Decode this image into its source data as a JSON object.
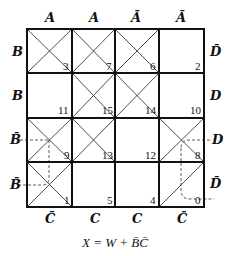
{
  "kmap": {
    "col_labels_top": [
      "A",
      "A",
      "Ā",
      "Ā"
    ],
    "col_labels_bottom": [
      "C̄",
      "C",
      "C",
      "C̄"
    ],
    "row_labels_left": [
      "B",
      "B",
      "B̄",
      "B̄"
    ],
    "row_labels_right": [
      "D̄",
      "D",
      "D",
      "D̄"
    ],
    "cells": [
      [
        {
          "minterm": "3",
          "mark": "x"
        },
        {
          "minterm": "7",
          "mark": "x"
        },
        {
          "minterm": "6",
          "mark": "x"
        },
        {
          "minterm": "2",
          "mark": "none"
        }
      ],
      [
        {
          "minterm": "11",
          "mark": "none"
        },
        {
          "minterm": "15",
          "mark": "x"
        },
        {
          "minterm": "14",
          "mark": "x"
        },
        {
          "minterm": "10",
          "mark": "none"
        }
      ],
      [
        {
          "minterm": "9",
          "mark": "x"
        },
        {
          "minterm": "13",
          "mark": "x"
        },
        {
          "minterm": "12",
          "mark": "none"
        },
        {
          "minterm": "8",
          "mark": "x"
        }
      ],
      [
        {
          "minterm": "1",
          "mark": "x"
        },
        {
          "minterm": "5",
          "mark": "none"
        },
        {
          "minterm": "4",
          "mark": "none"
        },
        {
          "minterm": "0",
          "mark": "diag"
        }
      ]
    ]
  },
  "formula": "X = W + B̄C̄"
}
